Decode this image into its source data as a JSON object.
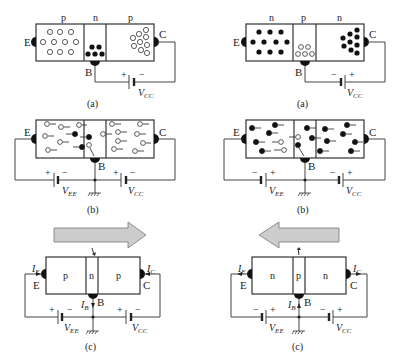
{
  "figure": {
    "left_column": {
      "type": "pnp",
      "panel_a": {
        "regions": [
          "p",
          "n",
          "p"
        ],
        "terminals": {
          "emitter": "E",
          "base": "B",
          "collector": "C"
        },
        "battery": {
          "label": "V_CC",
          "pos": "+",
          "neg": "−"
        },
        "caption": "(a)"
      },
      "panel_b": {
        "terminals": {
          "emitter": "E",
          "base": "B",
          "collector": "C"
        },
        "battery_ee": {
          "label": "V_EE",
          "pos": "+",
          "neg": "−"
        },
        "battery_cc": {
          "label": "V_CC",
          "pos": "+",
          "neg": "−"
        },
        "caption": "(b)"
      },
      "panel_c": {
        "regions": [
          "p",
          "n",
          "p"
        ],
        "terminals": {
          "emitter": "E",
          "base": "B",
          "collector": "C"
        },
        "currents": {
          "ie": "I_E",
          "ib": "I_B",
          "ic": "I_C"
        },
        "battery_ee": {
          "label": "V_EE",
          "pos": "+",
          "neg": "−"
        },
        "battery_cc": {
          "label": "V_CC",
          "pos": "+",
          "neg": "−"
        },
        "flow_direction": "right",
        "caption": "(c)"
      }
    },
    "right_column": {
      "type": "npn",
      "panel_a": {
        "regions": [
          "n",
          "p",
          "n"
        ],
        "terminals": {
          "emitter": "E",
          "base": "B",
          "collector": "C"
        },
        "battery": {
          "label": "V_CC",
          "pos": "+",
          "neg": "−"
        },
        "caption": "(a)"
      },
      "panel_b": {
        "terminals": {
          "emitter": "E",
          "base": "B",
          "collector": "C"
        },
        "battery_ee": {
          "label": "V_EE",
          "pos": "+",
          "neg": "−"
        },
        "battery_cc": {
          "label": "V_CC",
          "pos": "+",
          "neg": "−"
        },
        "caption": "(b)"
      },
      "panel_c": {
        "regions": [
          "n",
          "p",
          "n"
        ],
        "terminals": {
          "emitter": "E",
          "base": "B",
          "collector": "C"
        },
        "currents": {
          "ie": "I_E",
          "ib": "I_B",
          "ic": "I_C"
        },
        "battery_ee": {
          "label": "V_EE",
          "pos": "+",
          "neg": "−"
        },
        "battery_cc": {
          "label": "V_CC",
          "pos": "+",
          "neg": "−"
        },
        "flow_direction": "left",
        "caption": "(c)"
      }
    }
  },
  "text": {
    "p": "p",
    "n": "n",
    "E": "E",
    "B": "B",
    "C": "C",
    "plus": "+",
    "minus": "−",
    "V": "V",
    "EE": "EE",
    "CC": "CC",
    "I": "I",
    "sub_E": "E",
    "sub_B": "B",
    "sub_C": "C",
    "cap_a": "(a)",
    "cap_b": "(b)",
    "cap_c": "(c)"
  }
}
